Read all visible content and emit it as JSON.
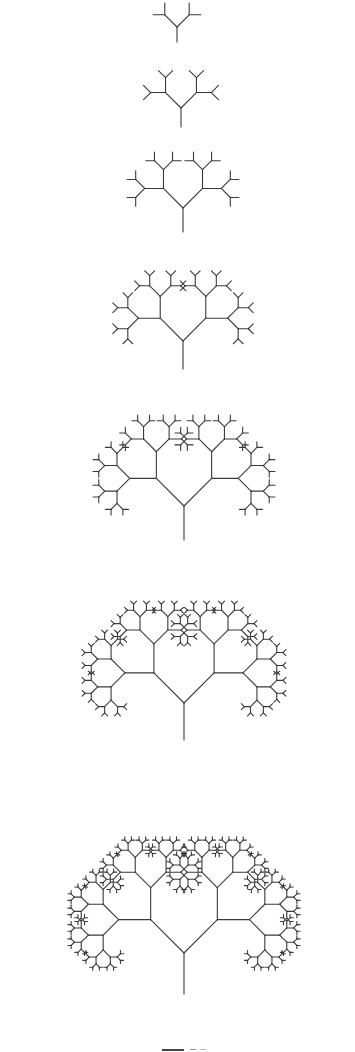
{
  "figure": {
    "stroke_color": "#3a3a3a",
    "stroke_width": 1.1,
    "branch_angle_deg": 45,
    "first_branch_ratio": 1.15,
    "length_ratio": 0.68,
    "trees": [
      {
        "generation": 1,
        "root_x": 177,
        "root_y": 42,
        "trunk": 15,
        "levels": 2
      },
      {
        "generation": 2,
        "root_x": 181,
        "root_y": 127,
        "trunk": 19,
        "levels": 3
      },
      {
        "generation": 3,
        "root_x": 183,
        "root_y": 232,
        "trunk": 24,
        "levels": 4
      },
      {
        "generation": 4,
        "root_x": 183,
        "root_y": 369,
        "trunk": 28,
        "levels": 5
      },
      {
        "generation": 5,
        "root_x": 184,
        "root_y": 540,
        "trunk": 34,
        "levels": 6
      },
      {
        "generation": 6,
        "root_x": 184,
        "root_y": 740,
        "trunk": 37,
        "levels": 7
      },
      {
        "generation": 7,
        "root_x": 184,
        "root_y": 994,
        "trunk": 41,
        "levels": 8
      }
    ]
  }
}
